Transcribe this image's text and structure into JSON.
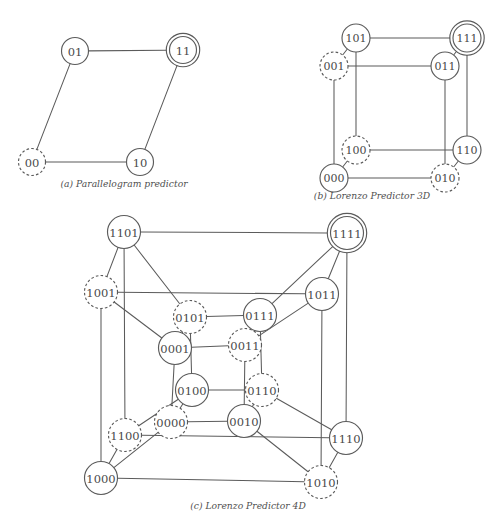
{
  "figure": {
    "stroke_color": "#5b5b5b",
    "label_color": "#4a4a4a",
    "background": "#ffffff"
  },
  "panels": [
    {
      "id": "a",
      "caption": "(a) Parallelogram predictor",
      "dimension": 2,
      "nodes": [
        {
          "label": "01",
          "x": 75,
          "y": 51,
          "r": 13.5,
          "style": "solid",
          "target": false
        },
        {
          "label": "11",
          "x": 183,
          "y": 50,
          "r": 13.5,
          "style": "solid",
          "target": true
        },
        {
          "label": "00",
          "x": 32,
          "y": 162,
          "r": 13.5,
          "style": "dashed",
          "target": false
        },
        {
          "label": "10",
          "x": 140,
          "y": 162,
          "r": 13.5,
          "style": "solid",
          "target": false
        }
      ],
      "edges": [
        [
          "01",
          "11"
        ],
        [
          "01",
          "00"
        ],
        [
          "00",
          "10"
        ],
        [
          "10",
          "11"
        ]
      ]
    },
    {
      "id": "b",
      "caption": "(b) Lorenzo Predictor 3D",
      "dimension": 3,
      "nodes": [
        {
          "label": "101",
          "x": 108,
          "y": 38,
          "r": 14.0,
          "style": "solid",
          "target": false
        },
        {
          "label": "111",
          "x": 219,
          "y": 38,
          "r": 14.0,
          "style": "solid",
          "target": true
        },
        {
          "label": "001",
          "x": 86,
          "y": 66,
          "r": 14.0,
          "style": "dashed",
          "target": false
        },
        {
          "label": "011",
          "x": 197,
          "y": 66,
          "r": 14.0,
          "style": "solid",
          "target": false
        },
        {
          "label": "100",
          "x": 108,
          "y": 150,
          "r": 14.0,
          "style": "dashed",
          "target": false
        },
        {
          "label": "110",
          "x": 219,
          "y": 150,
          "r": 14.0,
          "style": "solid",
          "target": false
        },
        {
          "label": "000",
          "x": 86,
          "y": 178,
          "r": 14.0,
          "style": "solid",
          "target": false
        },
        {
          "label": "010",
          "x": 197,
          "y": 178,
          "r": 14.0,
          "style": "dashed",
          "target": false
        }
      ],
      "edges": [
        [
          "101",
          "111"
        ],
        [
          "101",
          "001"
        ],
        [
          "101",
          "100"
        ],
        [
          "111",
          "011"
        ],
        [
          "111",
          "110"
        ],
        [
          "001",
          "011"
        ],
        [
          "001",
          "000"
        ],
        [
          "011",
          "010"
        ],
        [
          "100",
          "110"
        ],
        [
          "100",
          "000"
        ],
        [
          "110",
          "010"
        ],
        [
          "000",
          "010"
        ]
      ]
    },
    {
      "id": "c",
      "caption": "(c) Lorenzo Predictor 4D",
      "dimension": 4,
      "nodes": [
        {
          "label": "1101",
          "x": 84,
          "y": 20,
          "r": 16.5,
          "style": "solid",
          "target": false
        },
        {
          "label": "1111",
          "x": 307,
          "y": 21,
          "r": 16.5,
          "style": "solid",
          "target": true
        },
        {
          "label": "1001",
          "x": 61,
          "y": 80,
          "r": 16.5,
          "style": "dashed",
          "target": false
        },
        {
          "label": "1011",
          "x": 282,
          "y": 82,
          "r": 16.5,
          "style": "solid",
          "target": false
        },
        {
          "label": "0101",
          "x": 150,
          "y": 105,
          "r": 16.5,
          "style": "dashed",
          "target": false
        },
        {
          "label": "0111",
          "x": 220,
          "y": 103,
          "r": 16.5,
          "style": "solid",
          "target": false
        },
        {
          "label": "0001",
          "x": 135,
          "y": 136,
          "r": 16.5,
          "style": "solid",
          "target": false
        },
        {
          "label": "0011",
          "x": 205,
          "y": 133,
          "r": 16.5,
          "style": "dashed",
          "target": false
        },
        {
          "label": "0100",
          "x": 152,
          "y": 178,
          "r": 16.5,
          "style": "solid",
          "target": false
        },
        {
          "label": "0110",
          "x": 222,
          "y": 178,
          "r": 16.5,
          "style": "dashed",
          "target": false
        },
        {
          "label": "0000",
          "x": 131,
          "y": 210,
          "r": 16.5,
          "style": "dashed",
          "target": false
        },
        {
          "label": "0010",
          "x": 204,
          "y": 209,
          "r": 16.5,
          "style": "solid",
          "target": false
        },
        {
          "label": "1100",
          "x": 85,
          "y": 223,
          "r": 16.5,
          "style": "dashed",
          "target": false
        },
        {
          "label": "1110",
          "x": 306,
          "y": 226,
          "r": 16.5,
          "style": "solid",
          "target": false
        },
        {
          "label": "1000",
          "x": 61,
          "y": 266,
          "r": 16.5,
          "style": "solid",
          "target": false
        },
        {
          "label": "1010",
          "x": 281,
          "y": 270,
          "r": 16.5,
          "style": "dashed",
          "target": false
        }
      ],
      "edges": [
        [
          "1101",
          "1111"
        ],
        [
          "1101",
          "1001"
        ],
        [
          "1101",
          "0101"
        ],
        [
          "1101",
          "1100"
        ],
        [
          "1111",
          "1011"
        ],
        [
          "1111",
          "0111"
        ],
        [
          "1111",
          "1110"
        ],
        [
          "1001",
          "1011"
        ],
        [
          "1001",
          "0001"
        ],
        [
          "1001",
          "1000"
        ],
        [
          "1011",
          "0011"
        ],
        [
          "1011",
          "1010"
        ],
        [
          "0101",
          "0111"
        ],
        [
          "0101",
          "0001"
        ],
        [
          "0101",
          "0100"
        ],
        [
          "0111",
          "0011"
        ],
        [
          "0111",
          "0110"
        ],
        [
          "0001",
          "0011"
        ],
        [
          "0001",
          "0000"
        ],
        [
          "0011",
          "0010"
        ],
        [
          "0100",
          "0110"
        ],
        [
          "0100",
          "0000"
        ],
        [
          "0100",
          "1100"
        ],
        [
          "0110",
          "0010"
        ],
        [
          "0110",
          "1110"
        ],
        [
          "0000",
          "0010"
        ],
        [
          "0000",
          "1000"
        ],
        [
          "0010",
          "1010"
        ],
        [
          "1100",
          "1110"
        ],
        [
          "1100",
          "1000"
        ],
        [
          "1110",
          "1010"
        ],
        [
          "1000",
          "1010"
        ]
      ]
    }
  ]
}
